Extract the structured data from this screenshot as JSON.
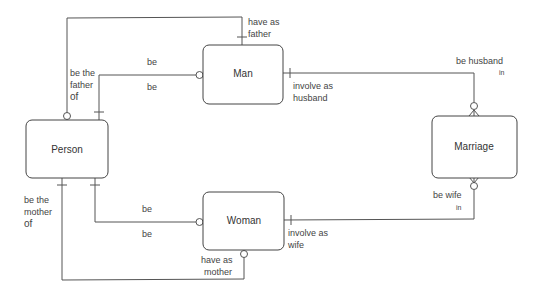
{
  "diagram": {
    "type": "entity-relationship",
    "entities": [
      {
        "id": "man",
        "label": "Man"
      },
      {
        "id": "person",
        "label": "Person"
      },
      {
        "id": "woman",
        "label": "Woman"
      },
      {
        "id": "marriage",
        "label": "Marriage"
      }
    ],
    "relationships": [
      {
        "id": "father",
        "from": "person",
        "to": "man",
        "labels": {
          "top": "have as",
          "top2": "father",
          "side1": "be the",
          "side2": "father",
          "side3": "of"
        }
      },
      {
        "id": "person-man",
        "from": "person",
        "to": "man",
        "labels": {
          "above": "be",
          "below": "be"
        }
      },
      {
        "id": "man-marriage",
        "from": "man",
        "to": "marriage",
        "labels": {
          "man_side1": "involve as",
          "man_side2": "husband",
          "marriage_side1": "be husband",
          "marriage_side2": "in"
        }
      },
      {
        "id": "person-woman",
        "from": "person",
        "to": "woman",
        "labels": {
          "above": "be",
          "below": "be"
        }
      },
      {
        "id": "woman-marriage",
        "from": "woman",
        "to": "marriage",
        "labels": {
          "woman_side1": "involve as",
          "woman_side2": "wife",
          "marriage_side1": "be wife",
          "marriage_side2": "in"
        }
      },
      {
        "id": "mother",
        "from": "person",
        "to": "woman",
        "labels": {
          "side1": "be the",
          "side2": "mother",
          "side3": "of",
          "woman_side1": "have as",
          "woman_side2": "mother"
        }
      }
    ]
  }
}
